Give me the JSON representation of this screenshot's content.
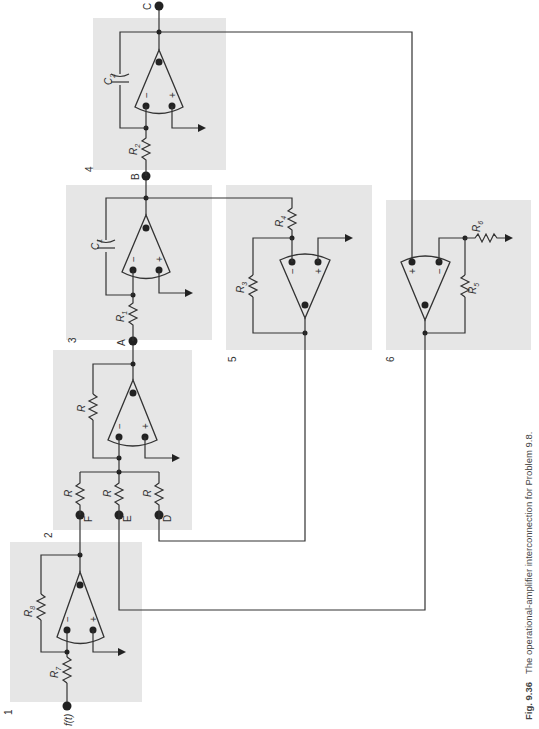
{
  "figure": {
    "number": "Fig. 9.36",
    "caption": "The operational-amplifier interconnection for Problem 9.8."
  },
  "blocks": [
    {
      "id": "1",
      "label": "1",
      "components": [
        "R7",
        "R8",
        "op-amp"
      ]
    },
    {
      "id": "2",
      "label": "2",
      "components": [
        "R (F)",
        "R (E)",
        "R (D)",
        "R (feedback)",
        "op-amp"
      ]
    },
    {
      "id": "3",
      "label": "3",
      "components": [
        "R1",
        "C1",
        "op-amp"
      ]
    },
    {
      "id": "4",
      "label": "4",
      "components": [
        "R2",
        "C2",
        "op-amp"
      ]
    },
    {
      "id": "5",
      "label": "5",
      "components": [
        "R3",
        "R4",
        "op-amp"
      ]
    },
    {
      "id": "6",
      "label": "6",
      "components": [
        "R5",
        "R6",
        "op-amp"
      ]
    }
  ],
  "labels": {
    "input": "f(t)",
    "R7": "R",
    "R7sub": "7",
    "R8": "R",
    "R8sub": "8",
    "R1": "R",
    "R1sub": "1",
    "R2": "R",
    "R2sub": "2",
    "R3": "R",
    "R3sub": "3",
    "R4": "R",
    "R4sub": "4",
    "R5": "R",
    "R5sub": "5",
    "R6": "R",
    "R6sub": "6",
    "C1": "C",
    "C1sub": "1",
    "C2": "C",
    "C2sub": "2",
    "R": "R",
    "minus": "−",
    "plus": "+"
  },
  "nodes": {
    "A": "A",
    "B": "B",
    "C": "C",
    "D": "D",
    "E": "E",
    "F": "F"
  }
}
